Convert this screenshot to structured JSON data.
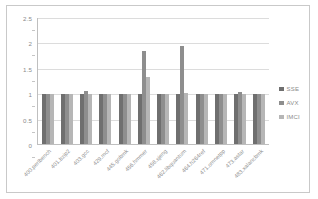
{
  "chart_data": {
    "type": "bar",
    "title": "",
    "subtitle": "",
    "xlabel": "",
    "ylabel": "",
    "ylim": [
      0,
      2.5
    ],
    "yticks": [
      "0",
      "0.5",
      "1",
      "1.5",
      "2",
      "2.5"
    ],
    "ytick_values": [
      0,
      0.5,
      1,
      1.5,
      2,
      2.5
    ],
    "grid": true,
    "legend_position": "right",
    "categories": [
      "400.perlbench",
      "401.bzip2",
      "403.gcc",
      "429.mcf",
      "445.gobmk",
      "456.hmmer",
      "458.sjeng",
      "462.libquantum",
      "464.h264ref",
      "471.omnetpp",
      "473.astar",
      "483.xalancbmk"
    ],
    "series": [
      {
        "name": "SSE",
        "color": "#6f6f6f",
        "values": [
          1.0,
          1.0,
          1.0,
          1.0,
          1.0,
          1.0,
          1.0,
          1.0,
          1.0,
          1.0,
          1.0,
          1.0
        ]
      },
      {
        "name": "AVX",
        "color": "#8e8e8e",
        "values": [
          1.0,
          1.0,
          1.06,
          1.0,
          1.0,
          1.85,
          1.0,
          1.95,
          1.0,
          1.0,
          1.04,
          1.0
        ]
      },
      {
        "name": "IMCI",
        "color": "#b6b6b6",
        "values": [
          1.0,
          1.0,
          1.0,
          1.0,
          1.0,
          1.32,
          1.0,
          1.02,
          1.0,
          1.0,
          1.0,
          0.99
        ]
      }
    ]
  },
  "legend": {
    "entries": [
      {
        "label": "SSE",
        "color": "#6f6f6f"
      },
      {
        "label": "AVX",
        "color": "#8e8e8e"
      },
      {
        "label": "IMCI",
        "color": "#b6b6b6"
      }
    ]
  }
}
